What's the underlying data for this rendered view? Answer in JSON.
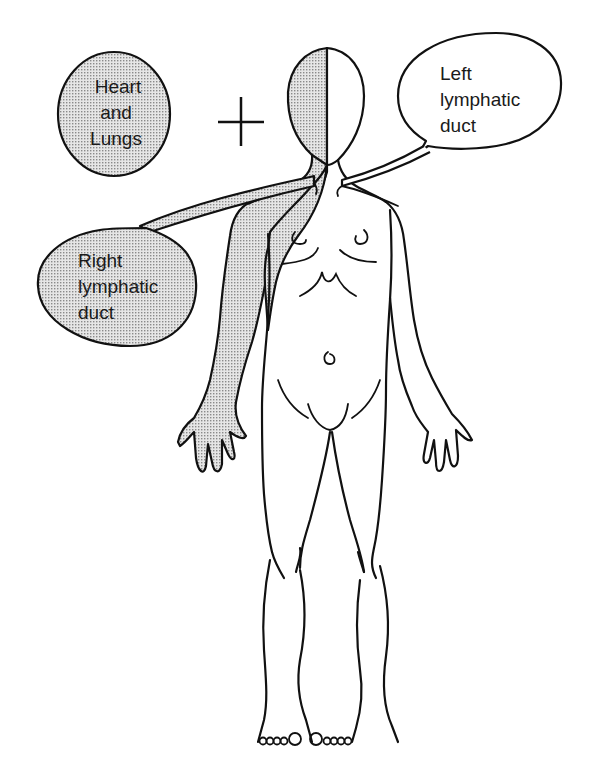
{
  "diagram": {
    "labels": {
      "heart_lungs": [
        "Heart",
        "and",
        "Lungs"
      ],
      "left_duct": [
        "Left",
        "lymphatic",
        "duct"
      ],
      "right_duct": [
        "Right",
        "lymphatic",
        "duct"
      ]
    },
    "plus_symbol": "+",
    "colors": {
      "line": "#111111",
      "shade_dot": "#8a8a8a",
      "background": "#ffffff"
    }
  }
}
